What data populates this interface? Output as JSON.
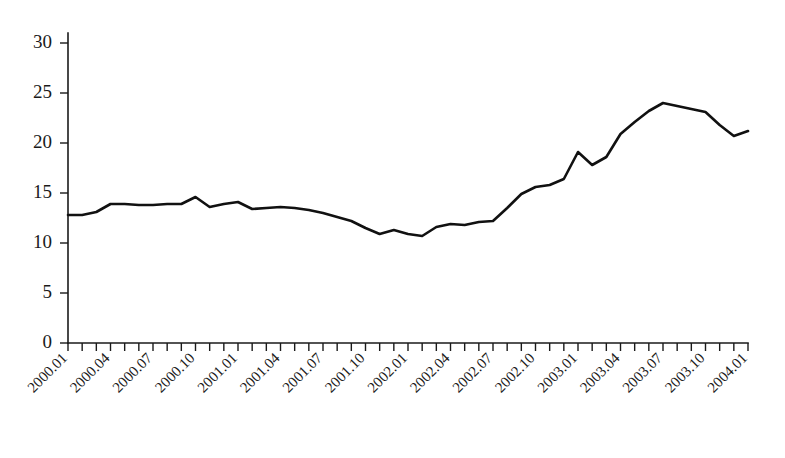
{
  "chart_data": {
    "type": "line",
    "title": "",
    "subtitle": "",
    "xlabel": "",
    "ylabel": "",
    "grid": false,
    "legend": "none",
    "ylim": [
      0,
      31
    ],
    "yticks": [
      0,
      5,
      10,
      15,
      20,
      25,
      30
    ],
    "ytick_labels": [
      "0",
      "5",
      "10",
      "15",
      "20",
      "25",
      "30"
    ],
    "xtick_labels": [
      "2000.01",
      "2000.04",
      "2000.07",
      "2000.10",
      "2001.01",
      "2001.04",
      "2001.07",
      "2001.10",
      "2002.01",
      "2002.04",
      "2002.07",
      "2002.10",
      "2003.01",
      "2003.04",
      "2003.07",
      "2003.10",
      "2004.01"
    ],
    "xtick_label_rotation_deg": -45,
    "xtick_interval_months": 3,
    "minor_tick_interval_months": 1,
    "x": [
      "2000.01",
      "2000.02",
      "2000.03",
      "2000.04",
      "2000.05",
      "2000.06",
      "2000.07",
      "2000.08",
      "2000.09",
      "2000.10",
      "2000.11",
      "2000.12",
      "2001.01",
      "2001.02",
      "2001.03",
      "2001.04",
      "2001.05",
      "2001.06",
      "2001.07",
      "2001.08",
      "2001.09",
      "2001.10",
      "2001.11",
      "2001.12",
      "2002.01",
      "2002.02",
      "2002.03",
      "2002.04",
      "2002.05",
      "2002.06",
      "2002.07",
      "2002.08",
      "2002.09",
      "2002.10",
      "2002.11",
      "2002.12",
      "2003.01",
      "2003.02",
      "2003.03",
      "2003.04",
      "2003.05",
      "2003.06",
      "2003.07",
      "2003.08",
      "2003.09",
      "2003.10",
      "2003.11",
      "2003.12",
      "2004.01"
    ],
    "values": [
      12.8,
      12.8,
      13.1,
      13.9,
      13.9,
      13.8,
      13.8,
      13.9,
      13.9,
      14.6,
      13.6,
      13.9,
      14.1,
      13.4,
      13.5,
      13.6,
      13.5,
      13.3,
      13.0,
      12.6,
      12.2,
      11.5,
      10.9,
      11.3,
      10.9,
      10.7,
      11.6,
      11.9,
      11.8,
      12.1,
      12.2,
      13.5,
      14.9,
      15.6,
      15.8,
      16.4,
      19.1,
      17.8,
      18.6,
      20.9,
      22.1,
      23.2,
      24.0,
      23.7,
      23.4,
      23.1,
      21.8,
      20.7,
      21.2
    ],
    "series_name": "value",
    "line_color": "#111111"
  }
}
